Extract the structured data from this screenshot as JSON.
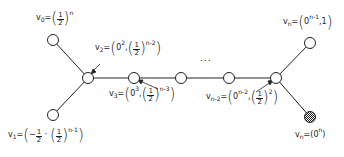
{
  "diagram": {
    "type": "tree-graph",
    "nodes": [
      {
        "id": "v0",
        "label": "v0",
        "value": "(1/2)^n",
        "x": 53,
        "y": 40,
        "filled": false
      },
      {
        "id": "v1",
        "label": "v1",
        "value": "(-1/2, (1/2)^(n-1))",
        "x": 53,
        "y": 115,
        "filled": false
      },
      {
        "id": "v2",
        "label": "v2",
        "value": "(0^2, (1/2)^(n-2))",
        "x": 88,
        "y": 78,
        "filled": false
      },
      {
        "id": "v3",
        "label": "v3",
        "value": "(0^3, (1/2)^(n-3))",
        "x": 134,
        "y": 78,
        "filled": false
      },
      {
        "id": "v4",
        "label": "",
        "value": "",
        "x": 181,
        "y": 78,
        "filled": false
      },
      {
        "id": "v5",
        "label": "",
        "value": "",
        "x": 229,
        "y": 78,
        "filled": false
      },
      {
        "id": "vn-2",
        "label": "vn-2",
        "value": "(0^(n-2), (1/2)^2)",
        "x": 276,
        "y": 78,
        "filled": false
      },
      {
        "id": "vn_top",
        "label": "vn",
        "value": "(0^(n-1), 1)",
        "x": 310,
        "y": 43,
        "filled": false
      },
      {
        "id": "vn_bottom",
        "label": "vn",
        "value": "(0^n)",
        "x": 310,
        "y": 117,
        "filled": true
      }
    ],
    "edges": [
      [
        "v0",
        "v2"
      ],
      [
        "v1",
        "v2"
      ],
      [
        "v2",
        "v3"
      ],
      [
        "v3",
        "v4"
      ],
      [
        "v4",
        "v5"
      ],
      [
        "v5",
        "vn-2"
      ],
      [
        "vn-2",
        "vn_top"
      ],
      [
        "vn-2",
        "vn_bottom"
      ]
    ],
    "ellipsis": "...",
    "labels": {
      "v0": {
        "name": "v",
        "sub": "0",
        "eq": "=",
        "num": "1",
        "den": "2",
        "exp": "n"
      },
      "v2": {
        "name": "v",
        "sub": "2",
        "eq": "=",
        "zero": "0",
        "zero_exp": "2",
        "num": "1",
        "den": "2",
        "exp": "n-2"
      },
      "v3": {
        "name": "v",
        "sub": "3",
        "eq": "=",
        "zero": "0",
        "zero_exp": "3",
        "num": "1",
        "den": "2",
        "exp": "n-3"
      },
      "v1": {
        "name": "v",
        "sub": "1",
        "eq": "=",
        "neg_num": "1",
        "neg_den": "2",
        "num": "1",
        "den": "2",
        "exp": "n-1"
      },
      "vn2": {
        "name": "v",
        "sub": "n-2",
        "eq": "=",
        "zero": "0",
        "zero_exp": "n-2",
        "num": "1",
        "den": "2",
        "exp": "2"
      },
      "vn_top": {
        "name": "v",
        "sub": "n",
        "eq": "=",
        "zero": "0",
        "zero_exp": "n-1",
        "tail": ",1"
      },
      "vn_bottom": {
        "name": "v",
        "sub": "n",
        "eq": "=",
        "zero": "0",
        "zero_exp": "n"
      }
    }
  }
}
